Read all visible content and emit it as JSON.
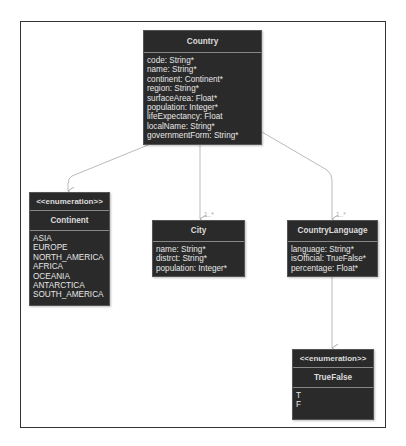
{
  "diagram": {
    "type": "UML class diagram",
    "classes": {
      "country": {
        "name": "Country",
        "attributes": [
          "code: String*",
          "name: String*",
          "continent: Continent*",
          "region: String*",
          "surfaceArea: Float*",
          "population: Integer*",
          "lifeExpectancy: Float",
          "localName: String*",
          "governmentForm: String*"
        ]
      },
      "continent": {
        "stereotype": "<<enumeration>>",
        "name": "Continent",
        "literals": [
          "ASIA",
          "EUROPE",
          "NORTH_AMERICA",
          "AFRICA",
          "OCEANIA",
          "ANTARCTICA",
          "SOUTH_AMERICA"
        ]
      },
      "city": {
        "name": "City",
        "attributes": [
          "name: String*",
          "distrct: String*",
          "population: Integer*"
        ]
      },
      "country_language": {
        "name": "CountryLanguage",
        "attributes": [
          "language: String*",
          "isOfficial: TrueFalse*",
          "percentage: Float*"
        ]
      },
      "true_false": {
        "stereotype": "<<enumeration>>",
        "name": "TrueFalse",
        "literals": [
          "T",
          "F"
        ]
      }
    },
    "associations": [
      {
        "from": "Country",
        "to": "Continent",
        "multiplicity": ""
      },
      {
        "from": "Country",
        "to": "City",
        "multiplicity": "1..*"
      },
      {
        "from": "Country",
        "to": "CountryLanguage",
        "multiplicity": "1..*"
      },
      {
        "from": "CountryLanguage",
        "to": "TrueFalse",
        "multiplicity": ""
      }
    ]
  }
}
